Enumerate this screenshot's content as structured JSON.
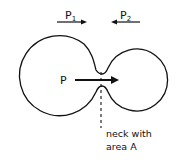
{
  "diagram": {
    "labels": {
      "p1_main": "P",
      "p1_sub": "1",
      "p2_main": "P",
      "p2_sub": "2",
      "p_center": "P",
      "neck_line1": "neck with",
      "neck_line2": "area A"
    },
    "colors": {
      "stroke": "#111111",
      "background": "#ffffff"
    }
  }
}
